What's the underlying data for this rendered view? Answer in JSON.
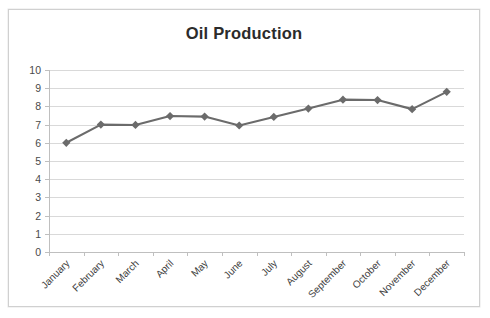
{
  "chart_data": {
    "type": "line",
    "title": "Oil Production",
    "xlabel": "",
    "ylabel": "",
    "categories": [
      "January",
      "February",
      "March",
      "April",
      "May",
      "June",
      "July",
      "August",
      "September",
      "October",
      "November",
      "December"
    ],
    "series": [
      {
        "name": "Oil Production",
        "values": [
          6.0,
          7.0,
          6.98,
          7.47,
          7.44,
          6.95,
          7.42,
          7.88,
          8.37,
          8.35,
          7.85,
          8.8
        ]
      }
    ],
    "ylim": [
      0,
      10
    ],
    "ytick_values": [
      0,
      1,
      2,
      3,
      4,
      5,
      6,
      7,
      8,
      9,
      10
    ],
    "ytick_labels": [
      "0",
      "1",
      "2",
      "3",
      "4",
      "5",
      "6",
      "7",
      "8",
      "9",
      "10"
    ],
    "grid": true,
    "grid_axis": "y",
    "legend": false,
    "legend_position": "none",
    "marker": "diamond",
    "xlabel_rotation": 45
  },
  "style": {
    "series_color": "#6b6b6b",
    "marker_color": "#6b6b6b",
    "grid_color": "#d9d9d9",
    "axis_color": "#bfbfbf",
    "title_color": "#2b2b2b",
    "tick_label_color": "#4a4a4a",
    "plot_background": "#ffffff",
    "frame_border_color": "#d0d0d0"
  }
}
